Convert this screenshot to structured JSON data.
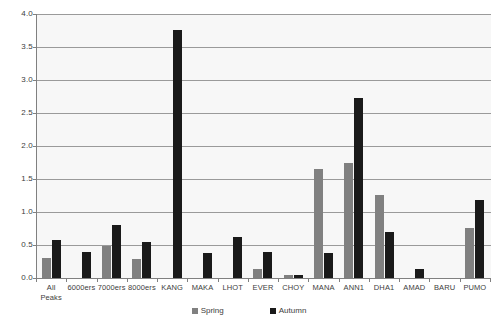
{
  "chart_data": {
    "type": "bar",
    "title": "",
    "subtitle": "",
    "xlabel": "",
    "ylabel": "",
    "ylim": [
      0.0,
      4.0
    ],
    "ytick_step": 0.5,
    "grid": true,
    "legend_position": "bottom",
    "categories": [
      "All\nPeaks",
      "6000ers",
      "7000ers",
      "8000ers",
      "KANG",
      "MAKA",
      "LHOT",
      "EVER",
      "CHOY",
      "MANA",
      "ANN1",
      "DHA1",
      "AMAD",
      "BARU",
      "PUMO"
    ],
    "ytick_labels": [
      "0.0",
      "0.5",
      "1.0",
      "1.5",
      "2.0",
      "2.5",
      "3.0",
      "3.5",
      "4.0"
    ],
    "series": [
      {
        "name": "Spring",
        "color": "#808080",
        "values": [
          0.31,
          0.0,
          0.49,
          0.29,
          0.0,
          0.0,
          0.0,
          0.14,
          0.04,
          1.65,
          1.75,
          1.26,
          0.0,
          0.0,
          0.76
        ]
      },
      {
        "name": "Autumn",
        "color": "#1a1a1a",
        "values": [
          0.58,
          0.4,
          0.81,
          0.55,
          3.76,
          0.38,
          0.62,
          0.4,
          0.05,
          0.38,
          2.73,
          0.69,
          0.13,
          0.0,
          1.18
        ]
      }
    ]
  },
  "legend": {
    "items": [
      {
        "label": "Spring",
        "color": "#808080"
      },
      {
        "label": "Autumn",
        "color": "#1a1a1a"
      }
    ]
  },
  "colors": {
    "plot_background": "#f7f7f7",
    "page_background": "#ffffff",
    "gridline": "#9a9a9a",
    "axis": "#808080",
    "text": "#3d3d3d"
  }
}
